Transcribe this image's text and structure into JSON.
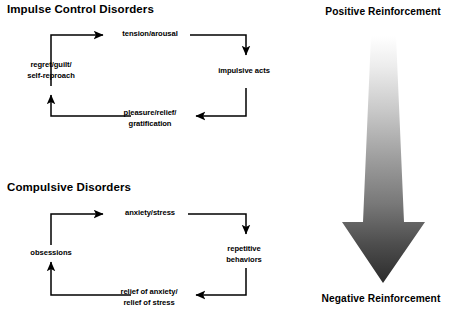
{
  "figure": {
    "background_color": "#ffffff",
    "line_color": "#000000",
    "text_color": "#000000"
  },
  "cycles": [
    {
      "id": "impulse-control",
      "title": "Impulse Control Disorders",
      "nodes": [
        {
          "id": "tension",
          "lines": [
            "tension/arousal"
          ]
        },
        {
          "id": "impulsive-acts",
          "lines": [
            "impulsive acts"
          ]
        },
        {
          "id": "pleasure",
          "lines": [
            "pleasure/relief/",
            "gratification"
          ]
        },
        {
          "id": "regret",
          "lines": [
            "regret/guilt/",
            "self-reproach"
          ]
        }
      ]
    },
    {
      "id": "compulsive",
      "title": "Compulsive Disorders",
      "nodes": [
        {
          "id": "anxiety",
          "lines": [
            "anxiety/stress"
          ]
        },
        {
          "id": "repetitive",
          "lines": [
            "repetitive",
            "behaviors"
          ]
        },
        {
          "id": "relief",
          "lines": [
            "relief of anxiety/",
            "relief of stress"
          ]
        },
        {
          "id": "obsessions",
          "lines": [
            "obsessions"
          ]
        }
      ]
    }
  ],
  "reinforcement": {
    "top_label": "Positive Reinforcement",
    "bottom_label": "Negative Reinforcement",
    "gradient": {
      "top_color": "#ffffff",
      "mid_color": "#8a8a8a",
      "bottom_color": "#2b2b2b"
    }
  }
}
